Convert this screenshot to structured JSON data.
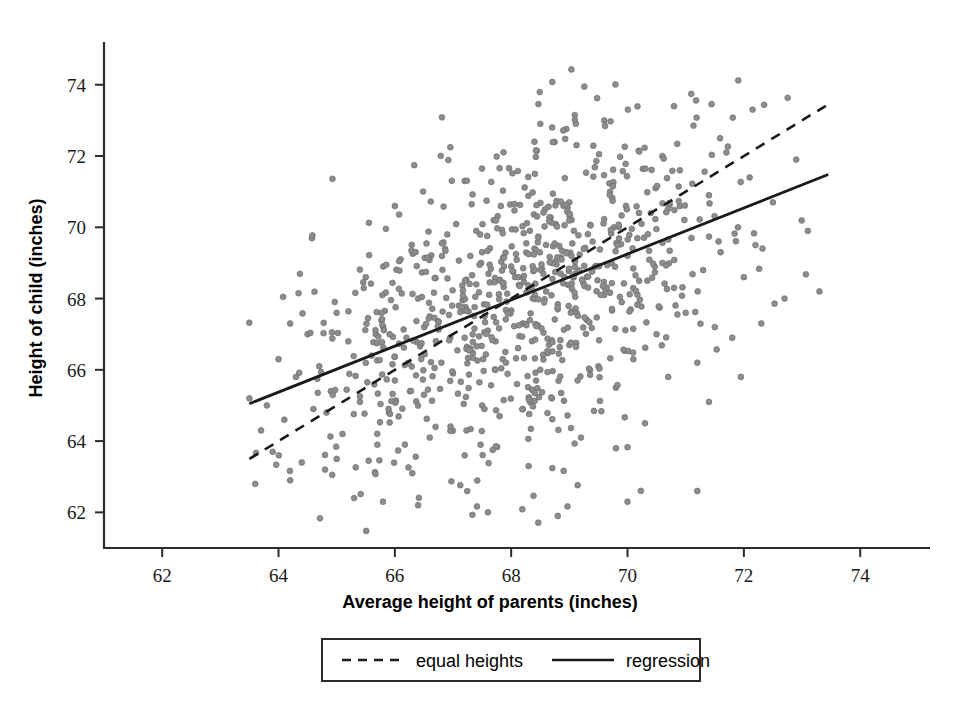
{
  "chart_data": {
    "type": "scatter",
    "title": "",
    "xlabel": "Average height of parents (inches)",
    "ylabel": "Height of child (inches)",
    "xlim": [
      61.0,
      75.2
    ],
    "ylim": [
      61.0,
      75.2
    ],
    "xticks": [
      62,
      64,
      66,
      68,
      70,
      72,
      74
    ],
    "yticks": [
      62,
      64,
      66,
      68,
      70,
      72,
      74
    ],
    "xtick_labels": [
      "62",
      "64",
      "66",
      "68",
      "70",
      "72",
      "74"
    ],
    "ytick_labels": [
      "62",
      "64",
      "66",
      "68",
      "70",
      "72",
      "74"
    ],
    "grid": false,
    "legend_position": "below-axes",
    "point_color": "#8d8d8d",
    "line_color": "#1a1a1a",
    "marker": "circle",
    "n_points": 898,
    "legend": [
      {
        "label": "equal heights",
        "style": "dashed"
      },
      {
        "label": "regression",
        "style": "solid"
      }
    ],
    "lines": [
      {
        "name": "equal heights",
        "style": "dashed",
        "equation": "y = x",
        "x": [
          63.5,
          73.45
        ],
        "y": [
          63.5,
          73.45
        ]
      },
      {
        "name": "regression",
        "style": "solid",
        "equation": "y = 0.646x + 24.0",
        "slope": 0.646,
        "intercept": 24.0,
        "x": [
          63.5,
          73.45
        ],
        "y": [
          65.05,
          71.48
        ]
      }
    ],
    "points": [
      [
        63.6,
        62.8
      ],
      [
        63.7,
        64.3
      ],
      [
        63.8,
        65.0
      ],
      [
        63.9,
        63.7
      ],
      [
        64.0,
        66.3
      ],
      [
        64.1,
        64.6
      ],
      [
        64.2,
        62.9
      ],
      [
        64.3,
        65.8
      ],
      [
        64.4,
        63.4
      ],
      [
        64.5,
        67.0
      ],
      [
        64.6,
        64.9
      ],
      [
        64.7,
        66.1
      ],
      [
        64.8,
        63.2
      ],
      [
        64.9,
        65.4
      ],
      [
        65.0,
        67.6
      ],
      [
        65.1,
        64.2
      ],
      [
        65.2,
        66.8
      ],
      [
        65.3,
        62.4
      ],
      [
        65.4,
        65.1
      ],
      [
        65.5,
        68.6
      ],
      [
        65.6,
        66.4
      ],
      [
        65.7,
        63.9
      ],
      [
        65.8,
        67.2
      ],
      [
        65.9,
        64.8
      ],
      [
        66.0,
        65.7
      ],
      [
        66.1,
        69.1
      ],
      [
        66.2,
        66.9
      ],
      [
        66.3,
        63.1
      ],
      [
        66.4,
        68.0
      ],
      [
        66.5,
        65.3
      ],
      [
        66.6,
        67.5
      ],
      [
        66.7,
        64.4
      ],
      [
        66.8,
        66.2
      ],
      [
        66.9,
        69.8
      ],
      [
        67.0,
        65.9
      ],
      [
        67.1,
        67.8
      ],
      [
        67.2,
        63.6
      ],
      [
        67.3,
        66.6
      ],
      [
        67.4,
        68.4
      ],
      [
        67.5,
        65.0
      ],
      [
        67.6,
        67.1
      ],
      [
        67.7,
        70.2
      ],
      [
        67.8,
        64.7
      ],
      [
        67.9,
        66.5
      ],
      [
        68.0,
        68.9
      ],
      [
        68.1,
        65.6
      ],
      [
        68.2,
        67.3
      ],
      [
        68.3,
        63.3
      ],
      [
        68.4,
        69.4
      ],
      [
        68.5,
        66.0
      ],
      [
        68.6,
        68.2
      ],
      [
        68.7,
        65.2
      ],
      [
        68.8,
        67.7
      ],
      [
        68.9,
        70.6
      ],
      [
        69.0,
        66.7
      ],
      [
        69.1,
        68.7
      ],
      [
        69.2,
        64.1
      ],
      [
        69.3,
        67.4
      ],
      [
        69.4,
        69.6
      ],
      [
        69.5,
        66.1
      ],
      [
        69.6,
        68.1
      ],
      [
        69.7,
        71.0
      ],
      [
        69.8,
        65.5
      ],
      [
        69.9,
        67.9
      ],
      [
        70.0,
        69.2
      ],
      [
        70.1,
        66.3
      ],
      [
        70.2,
        68.5
      ],
      [
        70.3,
        64.5
      ],
      [
        70.4,
        70.4
      ],
      [
        70.5,
        67.0
      ],
      [
        70.6,
        69.0
      ],
      [
        70.7,
        65.8
      ],
      [
        70.8,
        68.3
      ],
      [
        70.9,
        71.6
      ],
      [
        71.0,
        67.6
      ],
      [
        71.1,
        69.7
      ],
      [
        71.2,
        66.2
      ],
      [
        71.3,
        68.8
      ],
      [
        71.4,
        70.9
      ],
      [
        71.5,
        67.2
      ],
      [
        71.6,
        69.3
      ],
      [
        71.7,
        72.1
      ],
      [
        71.8,
        66.9
      ],
      [
        71.9,
        70.0
      ],
      [
        72.0,
        68.6
      ],
      [
        72.1,
        71.4
      ],
      [
        72.2,
        69.5
      ],
      [
        72.3,
        67.3
      ],
      [
        72.5,
        70.7
      ],
      [
        72.7,
        68.0
      ],
      [
        72.9,
        71.9
      ],
      [
        73.1,
        69.9
      ],
      [
        73.3,
        68.2
      ],
      [
        63.5,
        65.2
      ],
      [
        64.2,
        67.3
      ],
      [
        65.0,
        63.5
      ],
      [
        65.8,
        68.9
      ],
      [
        66.6,
        64.1
      ],
      [
        67.4,
        69.9
      ],
      [
        68.2,
        64.9
      ],
      [
        69.0,
        70.7
      ],
      [
        69.8,
        63.8
      ],
      [
        70.6,
        72.0
      ],
      [
        71.4,
        65.1
      ],
      [
        66.0,
        70.6
      ],
      [
        67.2,
        71.3
      ],
      [
        68.4,
        72.4
      ],
      [
        69.6,
        73.0
      ],
      [
        70.8,
        73.4
      ],
      [
        66.4,
        62.2
      ],
      [
        67.6,
        62.0
      ],
      [
        68.8,
        61.9
      ],
      [
        70.0,
        62.3
      ],
      [
        71.2,
        62.6
      ]
    ]
  },
  "labels": {
    "x_axis_title": "Average height of parents (inches)",
    "y_axis_title": "Height of child (inches)"
  },
  "legend": {
    "equal_heights": "equal heights",
    "regression": "regression"
  },
  "colors": {
    "point": "#8d8d8d",
    "line": "#1a1a1a",
    "axis": "#2b2b2b",
    "background": "#ffffff"
  }
}
